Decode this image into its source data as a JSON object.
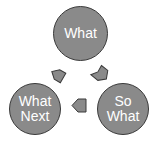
{
  "diagram": {
    "type": "cycle",
    "nodes": [
      {
        "id": "what",
        "lines": [
          "What"
        ]
      },
      {
        "id": "so-what",
        "lines": [
          "So",
          "What"
        ]
      },
      {
        "id": "what-next",
        "lines": [
          "What",
          "Next"
        ]
      }
    ],
    "edges": [
      {
        "from": "what",
        "to": "so-what"
      },
      {
        "from": "so-what",
        "to": "what-next"
      },
      {
        "from": "what-next",
        "to": "what"
      }
    ],
    "colors": {
      "node_fill": "#8a8a8a",
      "node_border": "#3a3a3a",
      "arrow_fill": "#8a8a8a",
      "text": "#ffffff"
    }
  }
}
